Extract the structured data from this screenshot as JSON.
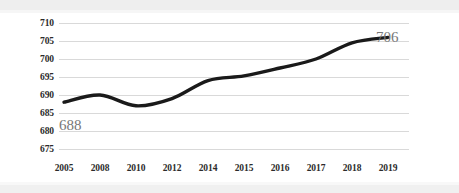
{
  "chart_data": {
    "type": "line",
    "title": "",
    "subtitle": "",
    "xlabel": "",
    "ylabel": "",
    "categories": [
      "2005",
      "2008",
      "2010",
      "2012",
      "2014",
      "2015",
      "2016",
      "2017",
      "2018",
      "2019"
    ],
    "values": [
      688,
      690,
      687,
      689,
      694,
      695.3,
      697.5,
      700,
      704.5,
      706
    ],
    "series": [
      {
        "name": "",
        "values": [
          688,
          690,
          687,
          689,
          694,
          695.3,
          697.5,
          700,
          704.5,
          706
        ]
      }
    ],
    "ylim": [
      675,
      710
    ],
    "yticks": [
      675,
      680,
      685,
      690,
      695,
      700,
      705,
      710
    ],
    "ytick_labels": [
      "675",
      "680",
      "685",
      "690",
      "695",
      "700",
      "705",
      "710"
    ],
    "xtick_labels": [
      "2005",
      "2008",
      "2010",
      "2012",
      "2014",
      "2015",
      "2016",
      "2017",
      "2018",
      "2019"
    ],
    "grid": true,
    "legend": false,
    "legend_position": "none",
    "annotations": [
      {
        "text": "688",
        "value": 688,
        "category": "2005",
        "position": "below-left-of-start"
      },
      {
        "text": "706",
        "value": 706,
        "category": "2019",
        "position": "above-right-of-end"
      }
    ],
    "line_color": "#1a1a1a",
    "grid_color": "#d9d9d9",
    "annotation_color": "#777777",
    "tick_color": "#2b2b2b",
    "background_color": "#ffffff"
  },
  "axes": {
    "y": {
      "ticks": [
        {
          "label": "710"
        },
        {
          "label": "705"
        },
        {
          "label": "700"
        },
        {
          "label": "695"
        },
        {
          "label": "690"
        },
        {
          "label": "685"
        },
        {
          "label": "680"
        },
        {
          "label": "675"
        }
      ]
    },
    "x": {
      "ticks": [
        {
          "label": "2005"
        },
        {
          "label": "2008"
        },
        {
          "label": "2010"
        },
        {
          "label": "2012"
        },
        {
          "label": "2014"
        },
        {
          "label": "2015"
        },
        {
          "label": "2016"
        },
        {
          "label": "2017"
        },
        {
          "label": "2018"
        },
        {
          "label": "2019"
        }
      ]
    }
  },
  "annotations": {
    "start_value": "688",
    "end_value": "706"
  }
}
